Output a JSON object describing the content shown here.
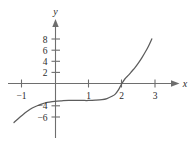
{
  "chart_data": {
    "type": "line",
    "title": "",
    "subtitle": "",
    "xlabel": "x",
    "ylabel": "y",
    "xlim": [
      -1.35,
      3.6
    ],
    "ylim": [
      -7.2,
      9.5
    ],
    "grid": false,
    "legend": null,
    "x_ticks": [
      -1,
      1,
      2,
      3
    ],
    "x_tick_labels": [
      "−1",
      "1",
      "2",
      "3"
    ],
    "y_ticks": [
      8,
      6,
      4,
      2,
      -4,
      -6
    ],
    "y_tick_labels": [
      "8",
      "6",
      "4",
      "2",
      "−4",
      "−6"
    ],
    "axis_color": "#6e6e6e",
    "curve_color": "#5c5c5c",
    "series": [
      {
        "name": "cubic curve",
        "x": [
          -1.25,
          -1.1,
          -1.0,
          -0.85,
          -0.7,
          -0.55,
          -0.4,
          -0.25,
          -0.1,
          0.05,
          0.2,
          0.4,
          0.6,
          0.8,
          1.0,
          1.2,
          1.4,
          1.55,
          1.7,
          1.8,
          1.9,
          2.0,
          2.1,
          2.2,
          2.3,
          2.4,
          2.5,
          2.6,
          2.7,
          2.8,
          2.9
        ],
        "y": [
          -7.0,
          -6.2,
          -5.7,
          -5.0,
          -4.4,
          -4.0,
          -3.65,
          -3.4,
          -3.25,
          -3.15,
          -3.1,
          -3.05,
          -3.05,
          -3.05,
          -3.05,
          -3.0,
          -2.9,
          -2.7,
          -2.3,
          -1.9,
          -1.1,
          0.0,
          0.9,
          1.5,
          2.2,
          2.9,
          3.7,
          4.6,
          5.6,
          6.7,
          8.0
        ]
      }
    ],
    "annotations": [
      {
        "label": "x-intercept",
        "x": 2,
        "y": 0
      }
    ]
  },
  "axis_labels": {
    "x_axis_name": "x",
    "y_axis_name": "y"
  }
}
